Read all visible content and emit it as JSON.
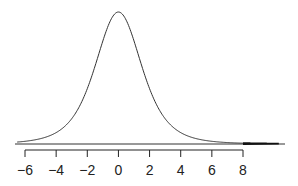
{
  "chart_data": {
    "type": "line",
    "title": "",
    "xlabel": "",
    "ylabel": "",
    "distribution": {
      "center": 0,
      "df": 4,
      "scale": 1.55
    },
    "xlim": [
      -6.6,
      10.6
    ],
    "x_ticks": [
      -6,
      -4,
      -2,
      0,
      2,
      4,
      6,
      8
    ],
    "x_tick_labels": [
      "−6",
      "−4",
      "−2",
      "0",
      "2",
      "4",
      "6",
      "8"
    ],
    "shaded_region": {
      "from": 8,
      "to": 10.3,
      "tail": "upper"
    },
    "grid": false,
    "legend": null,
    "colors": {
      "curve": "#333333",
      "axis": "#222222",
      "shade": "#111111",
      "baseline": "#333333"
    }
  }
}
